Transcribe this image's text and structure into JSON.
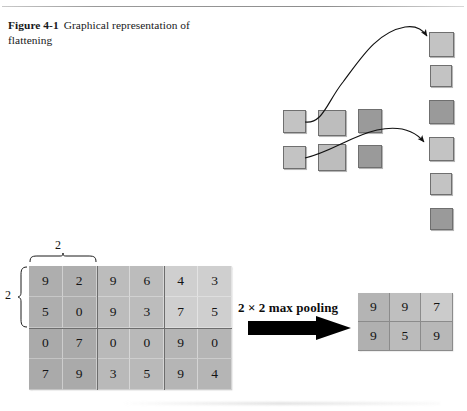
{
  "figure": {
    "label": "Figure 4-1",
    "caption": "Graphical representation of flattening"
  },
  "flatten_diagram": {
    "grid": {
      "rows": 2,
      "cols": 3,
      "shades": [
        [
          "light",
          "light2",
          "dark"
        ],
        [
          "light",
          "light2",
          "dark"
        ]
      ]
    },
    "column": {
      "count": 6,
      "shades": [
        "light",
        "light",
        "dark",
        "light",
        "light",
        "dark"
      ]
    },
    "arrows": 2
  },
  "pooling": {
    "operation_label": "2 × 2 max pooling",
    "arrow_icon": "right-arrow-icon",
    "window_label_top": "2",
    "window_label_left": "2",
    "input": {
      "rows": 4,
      "cols": 6,
      "values": [
        [
          "9",
          "2",
          "9",
          "6",
          "4",
          "3"
        ],
        [
          "5",
          "0",
          "9",
          "3",
          "7",
          "5"
        ],
        [
          "0",
          "7",
          "0",
          "0",
          "9",
          "0"
        ],
        [
          "7",
          "9",
          "3",
          "5",
          "9",
          "4"
        ]
      ],
      "block_shades": [
        [
          "blk-a",
          "blk-a",
          "blk-b",
          "blk-b",
          "blk-c",
          "blk-c"
        ],
        [
          "blk-a",
          "blk-a",
          "blk-b",
          "blk-b",
          "blk-c",
          "blk-c"
        ],
        [
          "blk-d",
          "blk-d",
          "blk-e",
          "blk-e",
          "blk-f",
          "blk-f"
        ],
        [
          "blk-d",
          "blk-d",
          "blk-e",
          "blk-e",
          "blk-f",
          "blk-f"
        ]
      ]
    },
    "output": {
      "rows": 2,
      "cols": 3,
      "values": [
        [
          "9",
          "9",
          "7"
        ],
        [
          "9",
          "5",
          "9"
        ]
      ],
      "shades": [
        [
          "oc-a",
          "oc-b",
          "oc-c"
        ],
        [
          "oc-d",
          "oc-e",
          "oc-f"
        ]
      ]
    }
  },
  "colors": {
    "page_background": "#ffffff",
    "text": "#141414",
    "square_light": "#c3c3c3",
    "square_dark": "#9a9a9a",
    "matrix_block_dark": "#aeaeae",
    "matrix_block_light": "#cfcfcf",
    "arrow_black": "#000000",
    "rule": "#9a9a9a"
  }
}
